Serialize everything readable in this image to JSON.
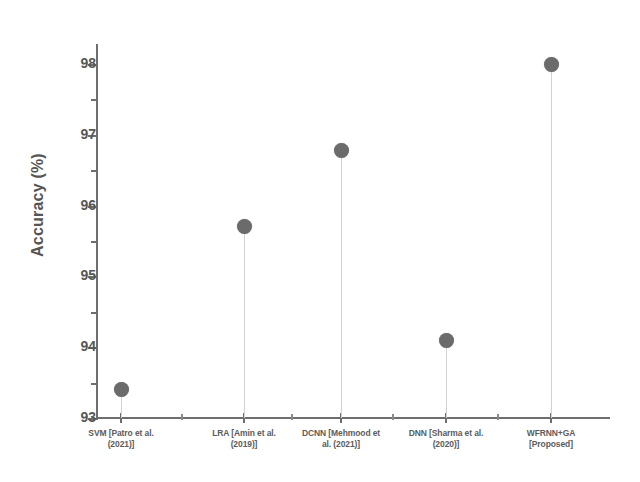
{
  "chart_data": {
    "type": "scatter",
    "title": "",
    "xlabel": "",
    "ylabel": "Accuracy (%)",
    "categories": [
      "SVM [Patro et al. (2021)]",
      "LRA [Amin et al. (2019)]",
      "DCNN [Mehmood et al. (2021)]",
      "DNN [Sharma et al. (2020)]",
      "WFRNN+GA [Proposed]"
    ],
    "category_lines": [
      [
        "SVM [Patro et al.",
        "(2021)]"
      ],
      [
        "LRA [Amin et al.",
        "(2019)]"
      ],
      [
        "DCNN [Mehmood et",
        "al. (2021)]"
      ],
      [
        "DNN [Sharma et al.",
        "(2020)]"
      ],
      [
        "WFRNN+GA",
        "[Proposed]"
      ]
    ],
    "values": [
      93.4,
      95.7,
      96.78,
      94.1,
      98.0
    ],
    "ylim": [
      93,
      98.3
    ],
    "ytick_labels": [
      "93",
      "94",
      "95",
      "96",
      "97",
      "98"
    ],
    "ytick_values": [
      93,
      94,
      95,
      96,
      97,
      98
    ],
    "yminor_values": [
      93.5,
      94.5,
      95.5,
      96.5,
      97.5
    ],
    "grid": false,
    "legend": "none",
    "marker_color": "#6b6b6b",
    "axis_color": "#6e6e6e",
    "dropline_color": "#d2d2d2"
  }
}
